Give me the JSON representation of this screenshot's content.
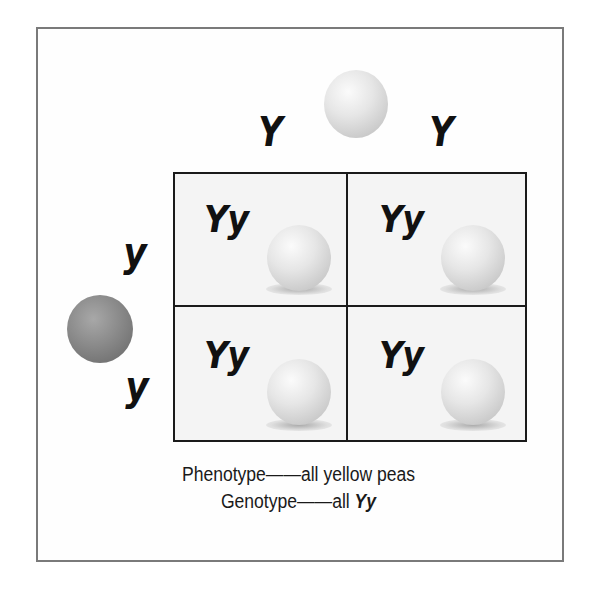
{
  "diagram": {
    "type": "punnett-square",
    "top_parent": {
      "pea_color": "yellow",
      "alleles": [
        "Y",
        "Y"
      ]
    },
    "side_parent": {
      "pea_color": "green",
      "alleles": [
        "y",
        "y"
      ]
    },
    "cells": [
      {
        "row": 0,
        "col": 0,
        "genotype": "Yy",
        "pea_color": "yellow"
      },
      {
        "row": 0,
        "col": 1,
        "genotype": "Yy",
        "pea_color": "yellow"
      },
      {
        "row": 1,
        "col": 0,
        "genotype": "Yy",
        "pea_color": "yellow"
      },
      {
        "row": 1,
        "col": 1,
        "genotype": "Yy",
        "pea_color": "yellow"
      }
    ],
    "caption": {
      "phenotype_line": "Phenotype——all yellow peas",
      "genotype_prefix": "Genotype——all ",
      "genotype_value": "Yy"
    },
    "colors": {
      "frame_border": "#7a7a7a",
      "grid_line": "#1a1a1a",
      "cell_fill": "#f4f4f4",
      "yellow_pea": "#e6e6e6",
      "green_pea": "#8a8a8a"
    }
  }
}
